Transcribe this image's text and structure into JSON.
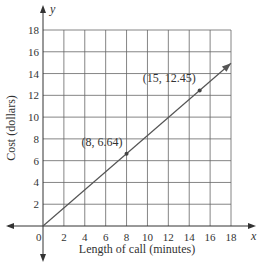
{
  "chart_data": {
    "type": "line",
    "title": "",
    "xlabel": "Length of call (minutes)",
    "ylabel": "Cost (dollars)",
    "x_axis_var": "x",
    "y_axis_var": "y",
    "origin_label": "0",
    "xlim": [
      0,
      18
    ],
    "ylim": [
      0,
      18
    ],
    "x_ticks": [
      2,
      4,
      6,
      8,
      10,
      12,
      14,
      16,
      18
    ],
    "y_ticks": [
      2,
      4,
      6,
      8,
      10,
      12,
      14,
      16,
      18
    ],
    "grid": true,
    "series": [
      {
        "name": "cost line",
        "x": [
          0,
          18
        ],
        "y": [
          0,
          14.94
        ],
        "color": "#555555",
        "arrow_end": true
      }
    ],
    "points": [
      {
        "x": 8,
        "y": 6.64,
        "label": "(8, 6.64)"
      },
      {
        "x": 15,
        "y": 12.45,
        "label": "(15, 12.45)"
      }
    ]
  },
  "colors": {
    "axis": "#333333",
    "grid": "#666666",
    "line": "#555555"
  }
}
